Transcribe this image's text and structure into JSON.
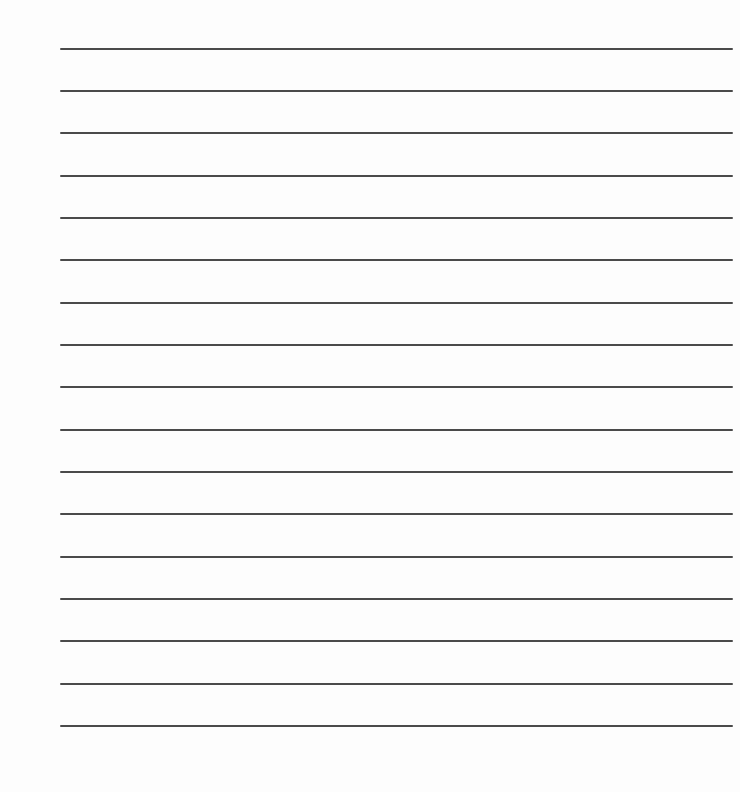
{
  "page": {
    "type": "lined-paper",
    "background_color": "#fdfdfd",
    "line_color": "#4a4a4a",
    "line_count": 17,
    "lines_y": [
      48,
      90,
      132,
      175,
      217,
      259,
      302,
      344,
      386,
      429,
      471,
      513,
      556,
      598,
      640,
      683,
      725
    ]
  }
}
